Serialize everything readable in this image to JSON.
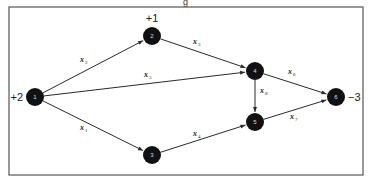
{
  "figure": {
    "title_fragment": "g",
    "frame": {
      "x": 9,
      "y": 7,
      "width": 354,
      "height": 168
    },
    "colors": {
      "node": "#111111",
      "edge": "#2a2a2a",
      "frame": "#555555",
      "text": "#222222"
    }
  },
  "nodes": [
    {
      "id": "1",
      "label": "1",
      "x": 35,
      "y": 97,
      "supply": "+2",
      "supply_pos": "left"
    },
    {
      "id": "2",
      "label": "2",
      "x": 152,
      "y": 36,
      "supply": "+1",
      "supply_pos": "top"
    },
    {
      "id": "3",
      "label": "3",
      "x": 152,
      "y": 155,
      "supply": "",
      "supply_pos": ""
    },
    {
      "id": "4",
      "label": "4",
      "x": 255,
      "y": 71,
      "supply": "",
      "supply_pos": ""
    },
    {
      "id": "5",
      "label": "5",
      "x": 255,
      "y": 122,
      "supply": "",
      "supply_pos": ""
    },
    {
      "id": "6",
      "label": "6",
      "x": 336,
      "y": 97,
      "supply": "−3",
      "supply_pos": "right"
    }
  ],
  "edges": [
    {
      "var": "x",
      "sub": "1",
      "from": "1",
      "to": "3",
      "lx": 80,
      "ly": 130
    },
    {
      "var": "x",
      "sub": "2",
      "from": "1",
      "to": "2",
      "lx": 80,
      "ly": 62
    },
    {
      "var": "x",
      "sub": "3",
      "from": "2",
      "to": "4",
      "lx": 193,
      "ly": 44
    },
    {
      "var": "x",
      "sub": "4",
      "from": "3",
      "to": "5",
      "lx": 193,
      "ly": 136
    },
    {
      "var": "x",
      "sub": "5",
      "from": "1",
      "to": "4",
      "lx": 144,
      "ly": 77
    },
    {
      "var": "x",
      "sub": "6",
      "from": "4",
      "to": "6",
      "lx": 288,
      "ly": 74
    },
    {
      "var": "x",
      "sub": "7",
      "from": "5",
      "to": "6",
      "lx": 290,
      "ly": 119
    },
    {
      "var": "x",
      "sub": "8",
      "from": "4",
      "to": "5",
      "lx": 260,
      "ly": 93
    }
  ]
}
